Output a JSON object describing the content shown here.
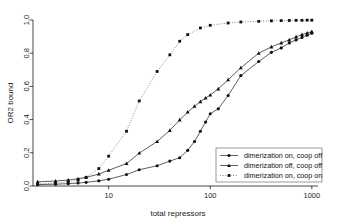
{
  "chart_data": {
    "type": "line",
    "title": "",
    "xlabel": "total repressors",
    "ylabel": "OR2 bound",
    "xscale": "log",
    "yscale": "linear",
    "xlim": [
      1.8,
      1150
    ],
    "ylim": [
      0.0,
      1.0
    ],
    "grid": false,
    "legend_position": "bottom-right",
    "xticks": [
      10,
      100,
      1000
    ],
    "xtick_labels": [
      "10",
      "100",
      "1000"
    ],
    "yticks": [
      0.0,
      0.2,
      0.4,
      0.6,
      0.8,
      1.0
    ],
    "ytick_labels": [
      "0.0",
      "0.2",
      "0.4",
      "0.6",
      "0.8",
      "1.0"
    ],
    "series": [
      {
        "name": "dimerization on, coop off",
        "marker": "circle",
        "linestyle": "solid",
        "color": "#111111",
        "x": [
          2,
          3,
          4,
          5,
          6,
          8,
          10,
          15,
          20,
          30,
          40,
          50,
          60,
          70,
          80,
          90,
          100,
          120,
          150,
          200,
          300,
          400,
          500,
          600,
          700,
          800,
          900,
          1000
        ],
        "y": [
          0.008,
          0.011,
          0.014,
          0.018,
          0.022,
          0.031,
          0.041,
          0.069,
          0.098,
          0.122,
          0.15,
          0.17,
          0.215,
          0.268,
          0.33,
          0.385,
          0.435,
          0.465,
          0.545,
          0.665,
          0.75,
          0.805,
          0.832,
          0.862,
          0.88,
          0.895,
          0.908,
          0.92
        ]
      },
      {
        "name": "dimerization off, coop off",
        "marker": "triangle",
        "linestyle": "solid",
        "color": "#111111",
        "x": [
          2,
          3,
          4,
          5,
          6,
          8,
          10,
          15,
          20,
          30,
          40,
          50,
          60,
          70,
          80,
          90,
          100,
          120,
          150,
          200,
          300,
          400,
          500,
          600,
          700,
          800,
          900,
          1000
        ],
        "y": [
          0.025,
          0.03,
          0.036,
          0.044,
          0.052,
          0.072,
          0.095,
          0.135,
          0.198,
          0.268,
          0.335,
          0.398,
          0.445,
          0.48,
          0.508,
          0.53,
          0.548,
          0.585,
          0.64,
          0.712,
          0.8,
          0.838,
          0.862,
          0.88,
          0.898,
          0.912,
          0.922,
          0.93
        ]
      },
      {
        "name": "dimerization on, coop on",
        "marker": "square",
        "linestyle": "dotted",
        "color": "#555555",
        "x": [
          2,
          3,
          4,
          5,
          6,
          8,
          10,
          15,
          20,
          30,
          40,
          50,
          60,
          80,
          100,
          150,
          200,
          300,
          400,
          500,
          600,
          700,
          800,
          900,
          1000
        ],
        "y": [
          0.012,
          0.018,
          0.025,
          0.035,
          0.052,
          0.105,
          0.18,
          0.33,
          0.512,
          0.69,
          0.79,
          0.872,
          0.912,
          0.952,
          0.968,
          0.982,
          0.988,
          0.992,
          0.995,
          0.996,
          0.997,
          0.998,
          0.998,
          0.999,
          0.999
        ]
      }
    ]
  },
  "legend": {
    "entries": [
      {
        "label": "dimerization on, coop off",
        "marker": "circle"
      },
      {
        "label": "dimerization off, coop off",
        "marker": "triangle"
      },
      {
        "label": "dimerization on, coop on",
        "marker": "square"
      }
    ]
  },
  "axes": {
    "x_title": "total repressors",
    "y_title": "OR2 bound"
  },
  "colors": {
    "foreground": "#1a1a1a",
    "marker": "#111111",
    "dotted_series": "#555555",
    "background": "#ffffff",
    "legend_border": "#6f6f6f"
  }
}
